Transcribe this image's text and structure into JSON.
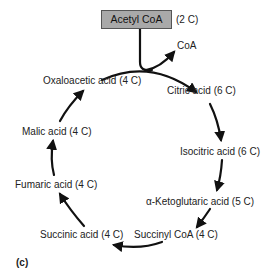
{
  "diagram": {
    "title_box": {
      "label": "Acetyl CoA",
      "carbons": "(2 C)",
      "fill": "#a9a9a9"
    },
    "side_product": "CoA",
    "panel_label": "(c)",
    "cycle": [
      {
        "id": "citric",
        "label": "Citric acid (6 C)"
      },
      {
        "id": "isocitric",
        "label": "Isocitric acid (6 C)"
      },
      {
        "id": "ketoglutaric",
        "label": "α-Ketoglutaric acid (5 C)"
      },
      {
        "id": "succinyl-coa",
        "label": "Succinyl CoA (4 C)"
      },
      {
        "id": "succinic",
        "label": "Succinic acid (4 C)"
      },
      {
        "id": "fumaric",
        "label": "Fumaric acid (4 C)"
      },
      {
        "id": "malic",
        "label": "Malic acid (4 C)"
      },
      {
        "id": "oxaloacetic",
        "label": "Oxaloacetic acid (4 C)"
      }
    ],
    "arrow_color": "#111111"
  }
}
